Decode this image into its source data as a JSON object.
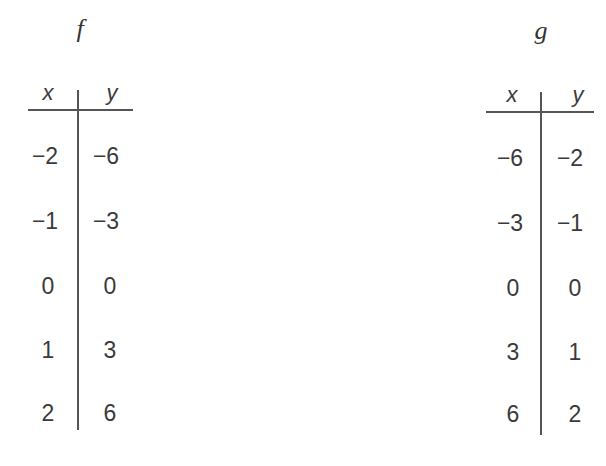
{
  "tables": [
    {
      "name": "f",
      "headers": [
        "x",
        "y"
      ],
      "rows": [
        {
          "x": "−2",
          "y": "−6"
        },
        {
          "x": "−1",
          "y": "−3"
        },
        {
          "x": "0",
          "y": "0"
        },
        {
          "x": "1",
          "y": "3"
        },
        {
          "x": "2",
          "y": "6"
        }
      ]
    },
    {
      "name": "g",
      "headers": [
        "x",
        "y"
      ],
      "rows": [
        {
          "x": "−6",
          "y": "−2"
        },
        {
          "x": "−3",
          "y": "−1"
        },
        {
          "x": "0",
          "y": "0"
        },
        {
          "x": "3",
          "y": "1"
        },
        {
          "x": "6",
          "y": "2"
        }
      ]
    }
  ]
}
